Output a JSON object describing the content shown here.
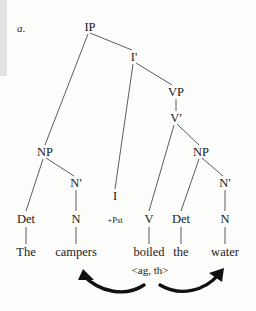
{
  "figure": {
    "label": "a.",
    "sentence": "The campers boiled the water",
    "theta_grid": "<ag, th>"
  },
  "tree": {
    "type": "x-bar-phrase-structure-tree",
    "nodes": [
      {
        "id": "IP",
        "label": "IP",
        "x": 90,
        "y": 27,
        "size": "normal"
      },
      {
        "id": "Ibar",
        "label": "I'",
        "x": 134,
        "y": 57,
        "size": "normal"
      },
      {
        "id": "VP",
        "label": "VP",
        "x": 176,
        "y": 92,
        "size": "normal"
      },
      {
        "id": "Vbar",
        "label": "V'",
        "x": 176,
        "y": 118,
        "size": "normal"
      },
      {
        "id": "NP1",
        "label": "NP",
        "x": 45,
        "y": 152,
        "size": "normal"
      },
      {
        "id": "Nbar1",
        "label": "N'",
        "x": 76,
        "y": 183,
        "size": "normal"
      },
      {
        "id": "NP2",
        "label": "NP",
        "x": 201,
        "y": 152,
        "size": "normal"
      },
      {
        "id": "Nbar2",
        "label": "N'",
        "x": 225,
        "y": 183,
        "size": "normal"
      },
      {
        "id": "Det1",
        "label": "Det",
        "x": 26,
        "y": 219,
        "size": "normal"
      },
      {
        "id": "N1",
        "label": "N",
        "x": 76,
        "y": 219,
        "size": "normal"
      },
      {
        "id": "I",
        "label": "I",
        "x": 115,
        "y": 196,
        "size": "normal"
      },
      {
        "id": "Pst",
        "label": "+Pst",
        "x": 115,
        "y": 220,
        "size": "small"
      },
      {
        "id": "V",
        "label": "V",
        "x": 149,
        "y": 219,
        "size": "normal"
      },
      {
        "id": "Det2",
        "label": "Det",
        "x": 181,
        "y": 219,
        "size": "normal"
      },
      {
        "id": "N2",
        "label": "N",
        "x": 225,
        "y": 219,
        "size": "normal"
      }
    ],
    "words": [
      {
        "id": "w-the1",
        "label": "The",
        "x": 26,
        "y": 252
      },
      {
        "id": "w-campers",
        "label": "campers",
        "x": 76,
        "y": 252
      },
      {
        "id": "w-boiled",
        "label": "boiled",
        "x": 149,
        "y": 252
      },
      {
        "id": "w-the2",
        "label": "the",
        "x": 181,
        "y": 252
      },
      {
        "id": "w-water",
        "label": "water",
        "x": 225,
        "y": 252
      }
    ],
    "branches": [
      {
        "from": "IP",
        "to": "NP1",
        "x1": 88,
        "y1": 34,
        "x2": 45,
        "y2": 145
      },
      {
        "from": "IP",
        "to": "Ibar",
        "x1": 90,
        "y1": 33,
        "x2": 132,
        "y2": 50
      },
      {
        "from": "Ibar",
        "to": "I",
        "x1": 133,
        "y1": 64,
        "x2": 115,
        "y2": 189
      },
      {
        "from": "Ibar",
        "to": "VP",
        "x1": 136,
        "y1": 63,
        "x2": 172,
        "y2": 85
      },
      {
        "from": "VP",
        "to": "Vbar",
        "x1": 176,
        "y1": 99,
        "x2": 176,
        "y2": 111
      },
      {
        "from": "Vbar",
        "to": "V",
        "x1": 174,
        "y1": 125,
        "x2": 149,
        "y2": 211
      },
      {
        "from": "Vbar",
        "to": "NP2",
        "x1": 177,
        "y1": 124,
        "x2": 199,
        "y2": 145
      },
      {
        "from": "NP1",
        "to": "Det1",
        "x1": 43,
        "y1": 159,
        "x2": 26,
        "y2": 211
      },
      {
        "from": "NP1",
        "to": "Nbar1",
        "x1": 46,
        "y1": 158,
        "x2": 74,
        "y2": 176
      },
      {
        "from": "Nbar1",
        "to": "N1",
        "x1": 76,
        "y1": 190,
        "x2": 76,
        "y2": 211
      },
      {
        "from": "NP2",
        "to": "Det2",
        "x1": 199,
        "y1": 159,
        "x2": 181,
        "y2": 211
      },
      {
        "from": "NP2",
        "to": "Nbar2",
        "x1": 202,
        "y1": 158,
        "x2": 223,
        "y2": 176
      },
      {
        "from": "Nbar2",
        "to": "N2",
        "x1": 225,
        "y1": 190,
        "x2": 225,
        "y2": 211
      },
      {
        "from": "Det1",
        "to": "w-the1",
        "x1": 26,
        "y1": 227,
        "x2": 26,
        "y2": 244
      },
      {
        "from": "N1",
        "to": "w-campers",
        "x1": 76,
        "y1": 227,
        "x2": 76,
        "y2": 244
      },
      {
        "from": "V",
        "to": "w-boiled",
        "x1": 149,
        "y1": 227,
        "x2": 149,
        "y2": 244
      },
      {
        "from": "Det2",
        "to": "w-the2",
        "x1": 181,
        "y1": 227,
        "x2": 181,
        "y2": 244
      },
      {
        "from": "N2",
        "to": "w-water",
        "x1": 225,
        "y1": 227,
        "x2": 225,
        "y2": 244
      }
    ]
  },
  "theta_arrows": [
    {
      "id": "arrow-agent",
      "role": "ag",
      "from_word": "boiled",
      "to_word": "campers",
      "curve": "M 144 285 C 126 297, 100 293, 83 275",
      "head": "83,269 94,280 78,280"
    },
    {
      "id": "arrow-theme",
      "role": "th",
      "from_word": "boiled",
      "to_word": "water",
      "curve": "M 160 285 C 180 297, 205 291, 219 274",
      "head": "224,268 222,282, 209,273"
    }
  ],
  "theta_label": {
    "text": "<ag, th>",
    "x": 150,
    "y": 270
  },
  "colors": {
    "ink": "#1a1a1a",
    "line": "#4a4a4a",
    "arrow": "#111111",
    "background": "#fdfdfc",
    "scan_edge": "#e2e2e2"
  }
}
